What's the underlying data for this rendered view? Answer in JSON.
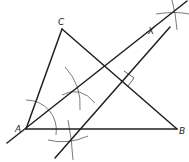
{
  "diagram": {
    "type": "geometric-construction",
    "labels": {
      "A": "A",
      "B": "B",
      "C": "C",
      "X": "X"
    },
    "points": {
      "A": [
        26,
        129
      ],
      "B": [
        177,
        129
      ],
      "C": [
        62,
        29
      ],
      "X": [
        153,
        38
      ]
    },
    "colors": {
      "stroke": "#231f20",
      "background": "#ffffff"
    }
  }
}
